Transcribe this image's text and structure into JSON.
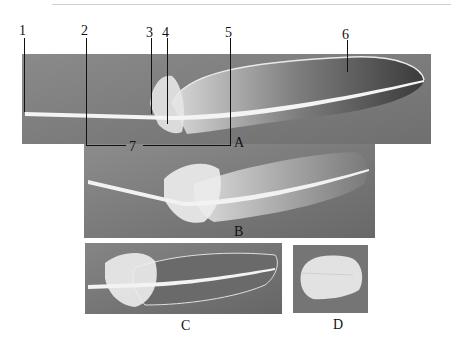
{
  "figure": {
    "top_rule_color": "#cfcfcf",
    "background_color": "#ffffff",
    "panel_background": "#7a7a7a"
  },
  "callouts": [
    {
      "id": "1",
      "label": "1"
    },
    {
      "id": "2",
      "label": "2"
    },
    {
      "id": "3",
      "label": "3"
    },
    {
      "id": "4",
      "label": "4"
    },
    {
      "id": "5",
      "label": "5"
    },
    {
      "id": "6",
      "label": "6"
    },
    {
      "id": "7",
      "label": "7"
    }
  ],
  "panels": [
    {
      "id": "A",
      "label": "A"
    },
    {
      "id": "B",
      "label": "B"
    },
    {
      "id": "C",
      "label": "C"
    },
    {
      "id": "D",
      "label": "D"
    }
  ]
}
